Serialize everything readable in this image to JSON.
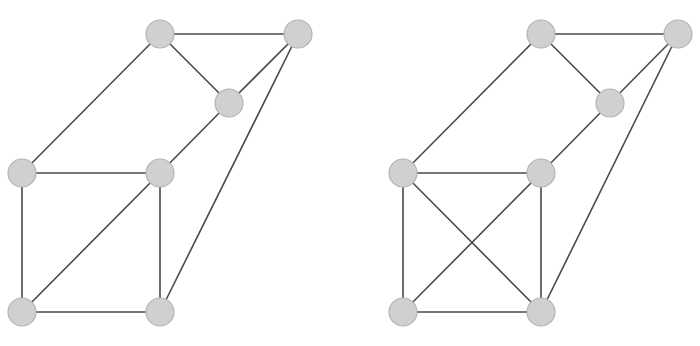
{
  "diagrams": [
    {
      "id": "left",
      "nodes": [
        "A",
        "B",
        "C",
        "D",
        "E",
        "F",
        "G"
      ],
      "edges": [
        [
          "A",
          "B"
        ],
        [
          "A",
          "C"
        ],
        [
          "B",
          "C"
        ],
        [
          "A",
          "D"
        ],
        [
          "C",
          "E"
        ],
        [
          "B",
          "G"
        ],
        [
          "D",
          "E"
        ],
        [
          "D",
          "F"
        ],
        [
          "E",
          "G"
        ],
        [
          "E",
          "F"
        ],
        [
          "F",
          "G"
        ]
      ]
    },
    {
      "id": "right",
      "nodes": [
        "A",
        "B",
        "C",
        "D",
        "E",
        "F",
        "G"
      ],
      "edges": [
        [
          "A",
          "B"
        ],
        [
          "A",
          "C"
        ],
        [
          "B",
          "C"
        ],
        [
          "A",
          "D"
        ],
        [
          "C",
          "E"
        ],
        [
          "B",
          "G"
        ],
        [
          "D",
          "E"
        ],
        [
          "D",
          "F"
        ],
        [
          "E",
          "G"
        ],
        [
          "E",
          "F"
        ],
        [
          "F",
          "G"
        ],
        [
          "D",
          "G"
        ]
      ]
    }
  ],
  "colors": {
    "edge": "#4a4a4a",
    "node_fill": "#d0d0d0",
    "node_stroke": "#b4b4b4",
    "background": "#ffffff"
  }
}
